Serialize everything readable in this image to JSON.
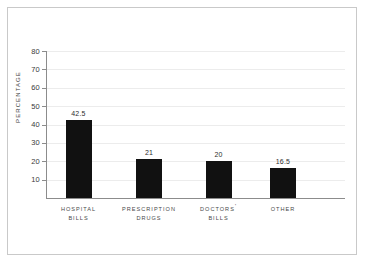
{
  "chart_data": {
    "type": "bar",
    "title": "",
    "xlabel": "",
    "ylabel": "PERCENTAGE",
    "categories": [
      "HOSPITAL BILLS",
      "PRESCRIPTION DRUGS",
      "DOCTORS' BILLS",
      "OTHER"
    ],
    "category_lines": [
      [
        "HOSPITAL",
        "BILLS"
      ],
      [
        "PRESCRIPTION",
        "DRUGS"
      ],
      [
        "DOCTORS'",
        "BILLS"
      ],
      [
        "OTHER"
      ]
    ],
    "values": [
      42.5,
      21,
      20,
      16.5
    ],
    "value_labels": [
      "42.5",
      "21",
      "20",
      "16.5"
    ],
    "ylim": [
      0,
      80
    ],
    "ytick_labels": [
      "80",
      "70",
      "60",
      "50",
      "40",
      "30",
      "20",
      "10"
    ],
    "ytick_values": [
      80,
      70,
      60,
      50,
      40,
      30,
      20,
      10
    ],
    "grid": true,
    "legend": false,
    "bar_color": "#111111",
    "grid_color": "#ececec",
    "axis_color": "#8c8c8c",
    "border_color": "#c9c9c9",
    "background": "#ffffff"
  }
}
